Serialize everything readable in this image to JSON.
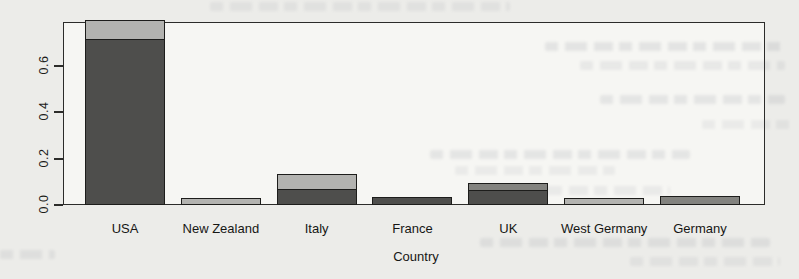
{
  "chart_data": {
    "type": "bar",
    "stacked": true,
    "title": "",
    "xlabel": "Country",
    "ylabel": "",
    "ylim": [
      0,
      0.79
    ],
    "yticks": [
      0.0,
      0.2,
      0.4,
      0.6
    ],
    "ytick_labels": [
      "0.0",
      "0.2",
      "0.4",
      "0.6"
    ],
    "grid": false,
    "legend": "none",
    "categories": [
      "USA",
      "New Zealand",
      "Italy",
      "France",
      "UK",
      "West Germany",
      "Germany"
    ],
    "bars": [
      {
        "label": "USA",
        "total": 0.8,
        "segments": [
          {
            "value": 0.72,
            "tone": "dark"
          },
          {
            "value": 0.08,
            "tone": "light"
          }
        ]
      },
      {
        "label": "New Zealand",
        "total": 0.03,
        "segments": [
          {
            "value": 0.03,
            "tone": "light"
          }
        ]
      },
      {
        "label": "Italy",
        "total": 0.133,
        "segments": [
          {
            "value": 0.065,
            "tone": "dark"
          },
          {
            "value": 0.068,
            "tone": "light"
          }
        ]
      },
      {
        "label": "France",
        "total": 0.034,
        "segments": [
          {
            "value": 0.034,
            "tone": "dark"
          }
        ]
      },
      {
        "label": "UK",
        "total": 0.095,
        "segments": [
          {
            "value": 0.065,
            "tone": "dark"
          },
          {
            "value": 0.03,
            "tone": "medium"
          }
        ]
      },
      {
        "label": "West Germany",
        "total": 0.03,
        "segments": [
          {
            "value": 0.03,
            "tone": "light"
          }
        ]
      },
      {
        "label": "Germany",
        "total": 0.037,
        "segments": [
          {
            "value": 0.037,
            "tone": "medium"
          }
        ]
      }
    ],
    "colors": {
      "dark": "#4e4e4c",
      "medium": "#83837f",
      "light": "#b3b3b0",
      "bar_border": "#1d1d1b",
      "axis": "#2c2c2a",
      "plot_background": "#f6f6f3",
      "page_background": "#ecece9"
    }
  }
}
